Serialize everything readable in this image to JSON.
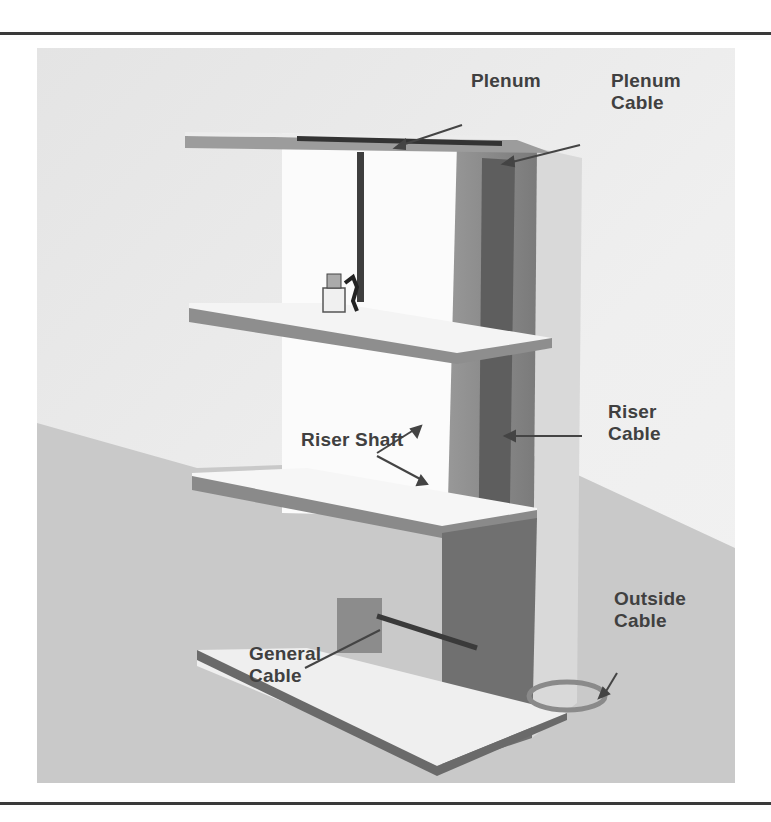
{
  "figure": {
    "colors": {
      "background": "#e9e9e9",
      "ground": "#c9c9c9",
      "floor_top": "#f4f4f4",
      "floor_edge": "#8a8a8a",
      "shaft": "#8f8f8f",
      "shaft_dark": "#6e6e6e",
      "cable": "#4a4a4a",
      "label_text": "#404040"
    },
    "labels": {
      "plenum": {
        "line1": "Plenum"
      },
      "plenum_cable": {
        "line1": "Plenum",
        "line2": "Cable"
      },
      "riser_shaft": {
        "line1": "Riser Shaft"
      },
      "riser_cable": {
        "line1": "Riser",
        "line2": "Cable"
      },
      "general_cable": {
        "line1": "General",
        "line2": "Cable"
      },
      "outside_cable": {
        "line1": "Outside",
        "line2": "Cable"
      }
    }
  }
}
